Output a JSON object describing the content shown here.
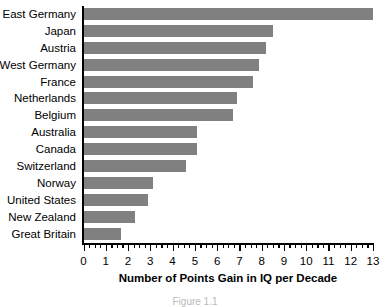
{
  "chart_data": {
    "type": "bar",
    "orientation": "horizontal",
    "title": "",
    "xlabel": "Number of Points Gain in IQ per Decade",
    "ylabel": "",
    "xlim": [
      0,
      13
    ],
    "xticks": [
      0,
      1,
      2,
      3,
      4,
      5,
      6,
      7,
      8,
      9,
      10,
      11,
      12,
      13
    ],
    "xtick_labels": [
      "0",
      "1",
      "2",
      "3",
      "4",
      "5",
      "6",
      "7",
      "8",
      "9",
      "10",
      "11",
      "12",
      "13"
    ],
    "minor_tick_interval": 0.25,
    "grid": false,
    "legend": null,
    "bar_color": "#808080",
    "axis_color": "#000000",
    "background_color": "#ffffff",
    "categories": [
      "East Germany",
      "Japan",
      "Austria",
      "West Germany",
      "France",
      "Netherlands",
      "Belgium",
      "Australia",
      "Canada",
      "Switzerland",
      "Norway",
      "United States",
      "New Zealand",
      "Great Britain"
    ],
    "values": [
      13.0,
      8.5,
      8.2,
      7.9,
      7.6,
      6.9,
      6.7,
      5.1,
      5.1,
      4.6,
      3.1,
      2.9,
      2.3,
      1.7
    ]
  },
  "caption": "Figure 1.1"
}
